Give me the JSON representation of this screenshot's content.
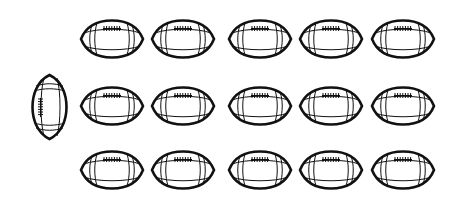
{
  "scene": {
    "description": "Counting picture of footballs",
    "background": "#ffffff",
    "stroke_color": "#111111",
    "outline_width": 2.6,
    "detail_width": 1.0
  },
  "standalone_ball": {
    "icon": "football-icon",
    "orientation": "vertical",
    "x": 31,
    "y": 73
  },
  "grid": {
    "rows": 3,
    "columns": 5,
    "total": 15,
    "column_x": [
      79,
      150,
      227,
      298,
      370
    ],
    "row_y": [
      19,
      86,
      150
    ],
    "icon": "football-icon",
    "orientation": "horizontal"
  }
}
